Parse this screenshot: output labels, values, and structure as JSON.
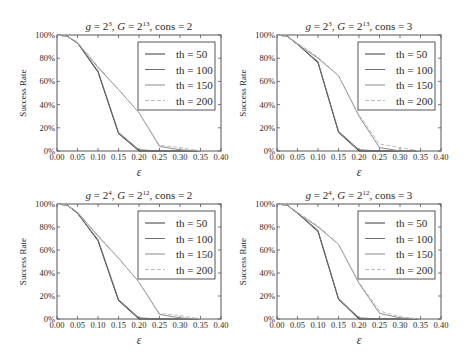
{
  "figure": {
    "ylabel": "Success Rate",
    "xlabel": "ε",
    "x_ticks": [
      "0.00",
      "0.05",
      "0.10",
      "0.15",
      "0.20",
      "0.25",
      "0.30",
      "0.35",
      "0.40"
    ],
    "y_ticks": [
      "0%",
      "20%",
      "40%",
      "60%",
      "80%",
      "100%"
    ],
    "legend": [
      "th = 50",
      "th = 100",
      "th = 150",
      "th = 200"
    ],
    "series_colors": [
      "#3a3a3a",
      "#6e6e6e",
      "#8c8c8c",
      "#bdbdbd"
    ]
  },
  "chart_data": [
    {
      "type": "line",
      "title": "g = 2^3, G = 2^13, cons = 2",
      "title_parts": {
        "g_base": "2",
        "g_exp": "3",
        "G_base": "2",
        "G_exp": "13",
        "cons": "2"
      },
      "xlabel": "ε",
      "ylabel": "Success Rate",
      "xlim": [
        0,
        0.4
      ],
      "ylim": [
        0,
        100
      ],
      "legend_position": "upper right",
      "x": [
        0.0,
        0.025,
        0.05,
        0.1,
        0.15,
        0.2,
        0.25,
        0.3,
        0.35
      ],
      "series": [
        {
          "name": "th = 50",
          "style": "solid",
          "values": [
            100,
            99,
            93,
            68,
            15,
            0,
            0,
            0,
            0
          ]
        },
        {
          "name": "th = 100",
          "style": "solid",
          "values": [
            100,
            99,
            93,
            69,
            16,
            1,
            0,
            0,
            0
          ]
        },
        {
          "name": "th = 150",
          "style": "solid",
          "values": [
            100,
            99,
            93,
            72,
            53,
            33,
            4,
            1,
            0
          ]
        },
        {
          "name": "th = 200",
          "style": "dashed",
          "values": [
            100,
            99,
            94,
            73,
            53,
            33,
            5,
            3,
            0
          ]
        }
      ]
    },
    {
      "type": "line",
      "title": "g = 2^3, G = 2^13, cons = 3",
      "title_parts": {
        "g_base": "2",
        "g_exp": "3",
        "G_base": "2",
        "G_exp": "13",
        "cons": "3"
      },
      "xlabel": "ε",
      "ylabel": "Success Rate",
      "xlim": [
        0,
        0.4
      ],
      "ylim": [
        0,
        100
      ],
      "legend_position": "upper right",
      "x": [
        0.0,
        0.025,
        0.05,
        0.1,
        0.15,
        0.2,
        0.25,
        0.3,
        0.35
      ],
      "series": [
        {
          "name": "th = 50",
          "style": "solid",
          "values": [
            100,
            99,
            92,
            76,
            16,
            0,
            0,
            0,
            0
          ]
        },
        {
          "name": "th = 100",
          "style": "solid",
          "values": [
            100,
            99,
            92,
            77,
            17,
            1,
            0,
            0,
            0
          ]
        },
        {
          "name": "th = 150",
          "style": "solid",
          "values": [
            100,
            99,
            92,
            80,
            65,
            30,
            3,
            0,
            0
          ]
        },
        {
          "name": "th = 200",
          "style": "dashed",
          "values": [
            100,
            99,
            93,
            81,
            65,
            31,
            6,
            3,
            0
          ]
        }
      ]
    },
    {
      "type": "line",
      "title": "g = 2^4, G = 2^12, cons = 2",
      "title_parts": {
        "g_base": "2",
        "g_exp": "4",
        "G_base": "2",
        "G_exp": "12",
        "cons": "2"
      },
      "xlabel": "ε",
      "ylabel": "Success Rate",
      "xlim": [
        0,
        0.4
      ],
      "ylim": [
        0,
        100
      ],
      "legend_position": "upper right",
      "x": [
        0.0,
        0.025,
        0.05,
        0.1,
        0.15,
        0.2,
        0.25,
        0.3,
        0.35
      ],
      "series": [
        {
          "name": "th = 50",
          "style": "solid",
          "values": [
            100,
            99,
            92,
            68,
            16,
            0,
            0,
            0,
            0
          ]
        },
        {
          "name": "th = 100",
          "style": "solid",
          "values": [
            100,
            99,
            92,
            69,
            17,
            1,
            0,
            0,
            0
          ]
        },
        {
          "name": "th = 150",
          "style": "solid",
          "values": [
            100,
            99,
            93,
            72,
            53,
            32,
            4,
            1,
            0
          ]
        },
        {
          "name": "th = 200",
          "style": "dashed",
          "values": [
            100,
            99,
            93,
            73,
            53,
            32,
            5,
            3,
            0
          ]
        }
      ]
    },
    {
      "type": "line",
      "title": "g = 2^4, G = 2^12, cons = 3",
      "title_parts": {
        "g_base": "2",
        "g_exp": "4",
        "G_base": "2",
        "G_exp": "12",
        "cons": "3"
      },
      "xlabel": "ε",
      "ylabel": "Success Rate",
      "xlim": [
        0,
        0.4
      ],
      "ylim": [
        0,
        100
      ],
      "legend_position": "upper right",
      "x": [
        0.0,
        0.025,
        0.05,
        0.1,
        0.15,
        0.2,
        0.25,
        0.3,
        0.35
      ],
      "series": [
        {
          "name": "th = 50",
          "style": "solid",
          "values": [
            100,
            99,
            92,
            76,
            17,
            0,
            0,
            0,
            0
          ]
        },
        {
          "name": "th = 100",
          "style": "solid",
          "values": [
            100,
            99,
            92,
            77,
            18,
            1,
            0,
            0,
            0
          ]
        },
        {
          "name": "th = 150",
          "style": "solid",
          "values": [
            100,
            99,
            92,
            80,
            65,
            31,
            5,
            1,
            0
          ]
        },
        {
          "name": "th = 200",
          "style": "dashed",
          "values": [
            100,
            99,
            93,
            81,
            65,
            32,
            7,
            2,
            0
          ]
        }
      ]
    }
  ]
}
